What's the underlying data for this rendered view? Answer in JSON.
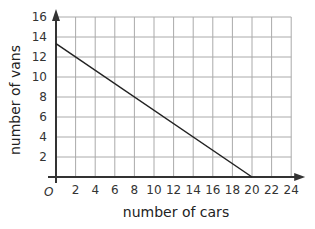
{
  "chart_data": {
    "type": "line",
    "title": "",
    "xlabel": "number of cars",
    "ylabel": "number of vans",
    "origin_label": "O",
    "xlim": [
      0,
      24
    ],
    "ylim": [
      0,
      16
    ],
    "x_ticks": [
      2,
      4,
      6,
      8,
      10,
      12,
      14,
      16,
      18,
      20,
      22,
      24
    ],
    "y_ticks": [
      2,
      4,
      6,
      8,
      10,
      12,
      14,
      16
    ],
    "grid": true,
    "grid_step": {
      "x": 2,
      "y": 2
    },
    "legend": null,
    "series": [
      {
        "name": "line",
        "points": [
          {
            "x": 0,
            "y": 13.33
          },
          {
            "x": 20,
            "y": 0
          }
        ],
        "color": "#222222"
      }
    ]
  },
  "colors": {
    "grid": "#aaaaaa",
    "axis": "#333333",
    "line": "#222222",
    "text": "#333333"
  }
}
